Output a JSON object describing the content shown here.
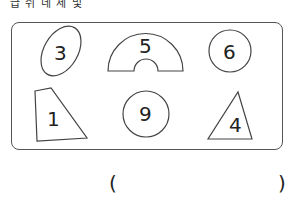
{
  "question_cutoff_text": "급 쉬 네 세 및 ",
  "shapes": [
    {
      "type": "ellipse",
      "label": "3"
    },
    {
      "type": "arch",
      "label": "5"
    },
    {
      "type": "circle",
      "label": "6"
    },
    {
      "type": "quadrilateral",
      "label": "1"
    },
    {
      "type": "circle",
      "label": "9"
    },
    {
      "type": "triangle",
      "label": "4"
    }
  ],
  "answer": {
    "open_paren": "(",
    "close_paren": ")",
    "value": ""
  }
}
